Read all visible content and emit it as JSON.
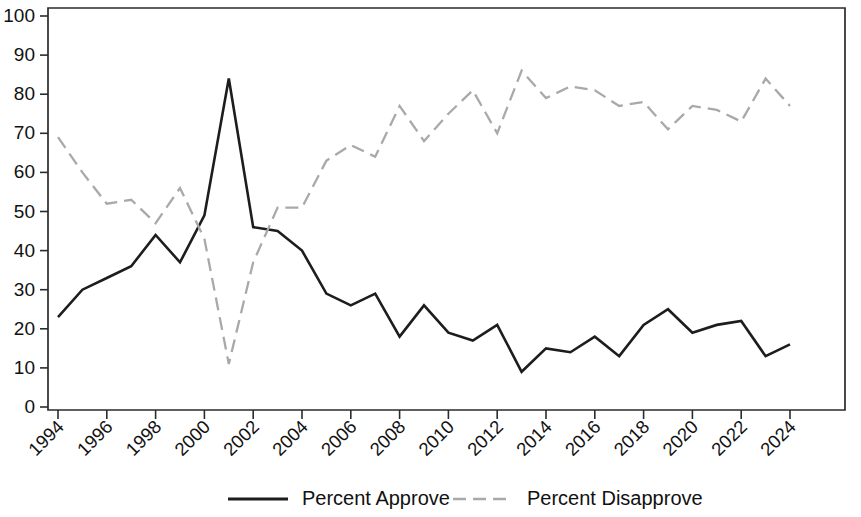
{
  "chart_data": {
    "type": "line",
    "title": "",
    "subtitle": "",
    "xlabel": "",
    "ylabel": "",
    "xlim": [
      1994,
      2024
    ],
    "ylim": [
      0,
      100
    ],
    "grid": false,
    "legend_position": "bottom",
    "x": [
      1994,
      1995,
      1996,
      1997,
      1998,
      1999,
      2000,
      2001,
      2002,
      2003,
      2004,
      2005,
      2006,
      2007,
      2008,
      2009,
      2010,
      2011,
      2012,
      2013,
      2014,
      2015,
      2016,
      2017,
      2018,
      2019,
      2020,
      2021,
      2022,
      2023,
      2024
    ],
    "xticks": [
      "1994",
      "1996",
      "1998",
      "2000",
      "2002",
      "2004",
      "2006",
      "2008",
      "2010",
      "2012",
      "2014",
      "2016",
      "2018",
      "2020",
      "2022",
      "2024"
    ],
    "xtick_values": [
      1994,
      1996,
      1998,
      2000,
      2002,
      2004,
      2006,
      2008,
      2010,
      2012,
      2014,
      2016,
      2018,
      2020,
      2022,
      2024
    ],
    "yticks": [
      "0",
      "10",
      "20",
      "30",
      "40",
      "50",
      "60",
      "70",
      "80",
      "90",
      "100"
    ],
    "ytick_values": [
      0,
      10,
      20,
      30,
      40,
      50,
      60,
      70,
      80,
      90,
      100
    ],
    "series": [
      {
        "name": "Percent Approve",
        "style": "solid",
        "color": "#1d1d1d",
        "values": [
          23,
          30,
          33,
          36,
          44,
          37,
          49,
          84,
          46,
          45,
          40,
          29,
          26,
          29,
          18,
          26,
          19,
          17,
          21,
          9,
          15,
          14,
          18,
          13,
          21,
          25,
          19,
          21,
          22,
          13,
          16
        ]
      },
      {
        "name": "Percent Disapprove",
        "style": "dashed",
        "color": "#a9a9a9",
        "values": [
          69,
          60,
          52,
          53,
          47,
          56,
          43,
          11,
          37,
          51,
          51,
          63,
          67,
          64,
          77,
          68,
          75,
          81,
          70,
          86,
          79,
          82,
          81,
          77,
          78,
          71,
          77,
          76,
          73,
          84,
          77
        ]
      }
    ],
    "legend": [
      {
        "label": "Percent Approve",
        "style": "solid",
        "color": "#1d1d1d"
      },
      {
        "label": "Percent Disapprove",
        "style": "dashed",
        "color": "#a9a9a9"
      }
    ]
  }
}
